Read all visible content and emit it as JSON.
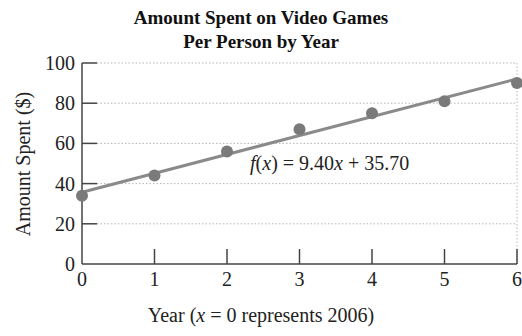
{
  "chart_data": {
    "type": "scatter",
    "title": "Amount Spent on Video Games",
    "subtitle": "Per Person by Year",
    "xlabel_prefix": "Year (",
    "xlabel_var": "x",
    "xlabel_suffix": " = 0 represents 2006)",
    "xlabel": "Year (x = 0 represents 2006)",
    "ylabel": "Amount Spent ($)",
    "x": [
      0,
      1,
      2,
      3,
      4,
      5,
      6
    ],
    "values": [
      34,
      44,
      56,
      67,
      75,
      81,
      90
    ],
    "xlim": [
      0,
      6
    ],
    "ylim": [
      0,
      100
    ],
    "xticks": [
      "0",
      "1",
      "2",
      "3",
      "4",
      "5",
      "6"
    ],
    "yticks": [
      "0",
      "20",
      "40",
      "60",
      "80",
      "100"
    ],
    "grid": "horizontal dotted",
    "trendline": {
      "slope": 9.4,
      "intercept": 35.7,
      "label": "f(x) = 9.40x + 35.70",
      "label_parts": {
        "f": "f",
        "open": "(",
        "x": "x",
        "close": ")",
        "eq": " = 9.40",
        "x2": "x",
        "rest": " + 35.70"
      }
    },
    "colors": {
      "points": "#7a7a7a",
      "line": "#8a8a8a",
      "axis": "#444444",
      "grid": "#b5b5b5"
    }
  }
}
